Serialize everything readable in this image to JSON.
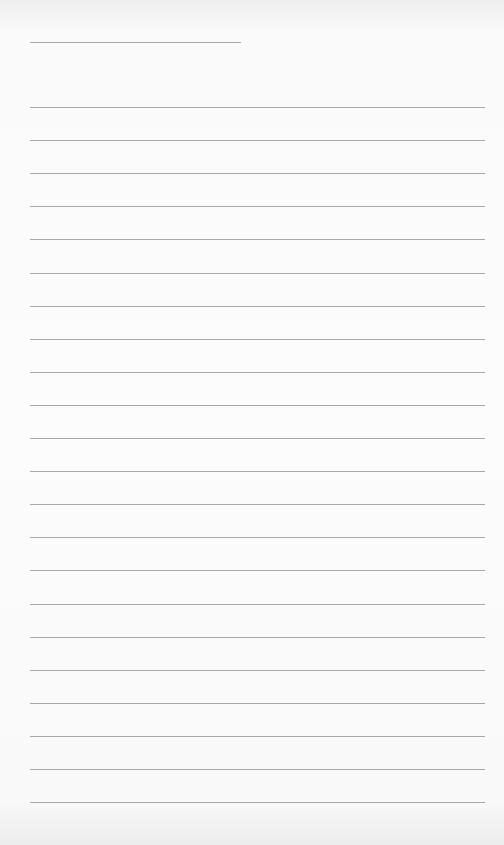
{
  "page": {
    "type": "lined-paper",
    "header_line": {
      "y": 42,
      "x": 30,
      "width": 211
    },
    "rules": {
      "count": 22,
      "first_y": 107,
      "spacing": 33.1,
      "x": 30,
      "width": 455
    },
    "colors": {
      "background": "#fafafa",
      "line": "#9a9a9a"
    },
    "text_content": []
  }
}
